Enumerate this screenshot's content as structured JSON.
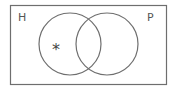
{
  "diagram": {
    "type": "venn",
    "universe": {
      "x": 10,
      "y": 5,
      "width": 156,
      "height": 79,
      "stroke": "#6e6e6e"
    },
    "sets": [
      {
        "label": "H",
        "cx": 70,
        "cy": 44,
        "r": 31,
        "label_x": 18,
        "label_y": 21
      },
      {
        "label": "P",
        "cx": 107,
        "cy": 44,
        "r": 31,
        "label_x": 147,
        "label_y": 21
      }
    ],
    "marker": {
      "symbol": "*",
      "region": "H only",
      "x": 57,
      "y": 52
    },
    "stroke_color": "#6e6e6e"
  }
}
